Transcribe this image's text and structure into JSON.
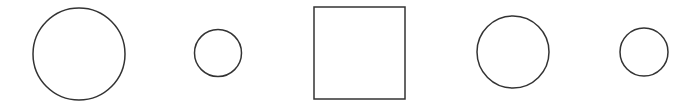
{
  "canvas": {
    "width": 695,
    "height": 104,
    "background": "#ffffff"
  },
  "style": {
    "stroke": "#333333",
    "stroke_width": 1.5,
    "fill": "none"
  },
  "shapes": [
    {
      "type": "circle",
      "label": "large-circle",
      "cx": 79,
      "cy": 54,
      "r": 46
    },
    {
      "type": "circle",
      "label": "small-circle",
      "cx": 218,
      "cy": 53,
      "r": 23.5
    },
    {
      "type": "square",
      "label": "square",
      "x": 314,
      "y": 7,
      "width": 91,
      "height": 92
    },
    {
      "type": "circle",
      "label": "medium-circle",
      "cx": 513,
      "cy": 52,
      "r": 36
    },
    {
      "type": "circle",
      "label": "small-circle-right",
      "cx": 644,
      "cy": 52,
      "r": 24
    }
  ]
}
